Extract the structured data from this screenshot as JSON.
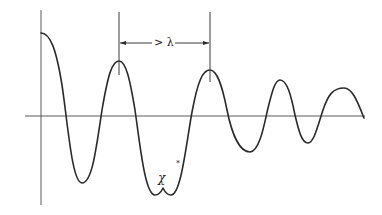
{
  "diagram": {
    "dimension_label": "> λ",
    "trough_label": "χ",
    "marker": "*",
    "colors": {
      "curve": "#2a2a2a",
      "axes": "#5a5a5a",
      "background": "#ffffff"
    },
    "axes": {
      "vertical": {
        "x": 41,
        "y_top": 10,
        "y_bottom": 205
      },
      "horizontal": {
        "y": 116,
        "x_left": 25,
        "x_right": 365
      }
    },
    "curve_points": [
      {
        "x": 41,
        "y": 33,
        "note": "start (maximum at origin)"
      },
      {
        "x": 82,
        "y": 183,
        "note": "first trough"
      },
      {
        "x": 119,
        "y": 61,
        "note": "first crest"
      },
      {
        "x": 155,
        "y": 195,
        "note": "trough left lobe"
      },
      {
        "x": 163,
        "y": 188,
        "note": "cusp labeled χ"
      },
      {
        "x": 171,
        "y": 195,
        "note": "trough right lobe"
      },
      {
        "x": 210,
        "y": 70,
        "note": "second crest"
      },
      {
        "x": 250,
        "y": 152,
        "note": "trough"
      },
      {
        "x": 280,
        "y": 80,
        "note": "crest"
      },
      {
        "x": 308,
        "y": 143,
        "note": "trough"
      },
      {
        "x": 344,
        "y": 88,
        "note": "crest"
      },
      {
        "x": 364,
        "y": 118,
        "note": "end"
      }
    ],
    "dimension_bracket": {
      "x_start": 119,
      "x_end": 210,
      "y": 43,
      "tick_top": 12,
      "tick_bottom_left": 75,
      "tick_bottom_right": 82
    }
  }
}
